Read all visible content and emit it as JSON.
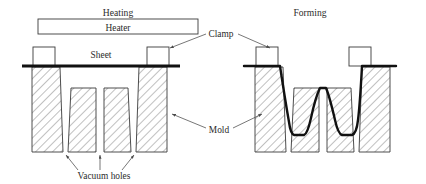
{
  "figure": {
    "caption_left": "Heating",
    "caption_right": "Forming",
    "heater_label": "Heater",
    "sheet_label": "Sheet",
    "clamp_label": "Clamp",
    "mold_label": "Mold",
    "vacuum_label": "Vacuum holes"
  },
  "colors": {
    "outline": "#3a3a3a",
    "sheet": "#111111",
    "hatch": "#6a6a6a",
    "text": "#2b2b2b",
    "leader": "#4a4a4a",
    "background": "#ffffff"
  },
  "geometry": {
    "canvas_width": 426,
    "canvas_height": 184,
    "baseline_y": 152,
    "sheet_y": 66,
    "heater_box": {
      "x": 38,
      "y": 19,
      "width": 160,
      "height": 15
    },
    "left_stage": {
      "clamp_left": {
        "x": 33,
        "y": 47,
        "width": 22,
        "height": 19
      },
      "clamp_right": {
        "x": 147,
        "y": 47,
        "width": 22,
        "height": 19
      },
      "molds": [
        {
          "name": "mold-block-1",
          "top_left": 32,
          "top_right": 60,
          "bottom_left": 32,
          "bottom_right": 63
        },
        {
          "name": "mold-block-2",
          "top_left": 71,
          "top_right": 96,
          "bottom_left": 68,
          "bottom_right": 96
        },
        {
          "name": "mold-block-3",
          "top_left": 104,
          "top_right": 128,
          "bottom_left": 104,
          "bottom_right": 131
        },
        {
          "name": "mold-block-4",
          "top_left": 139,
          "top_right": 167,
          "bottom_left": 136,
          "bottom_right": 167
        }
      ]
    },
    "right_stage": {
      "clamp_left": {
        "x": 256,
        "y": 47,
        "width": 22,
        "height": 19
      },
      "clamp_right": {
        "x": 349,
        "y": 47,
        "width": 22,
        "height": 19
      },
      "molds": [
        {
          "name": "mold-block-1",
          "top_left": 255,
          "top_right": 283,
          "bottom_left": 255,
          "bottom_right": 286
        },
        {
          "name": "mold-block-2",
          "top_left": 294,
          "top_right": 319,
          "bottom_left": 291,
          "bottom_right": 319
        },
        {
          "name": "mold-block-3",
          "top_left": 327,
          "top_right": 351,
          "bottom_left": 327,
          "bottom_right": 354
        },
        {
          "name": "mold-block-4",
          "top_left": 362,
          "top_right": 390,
          "bottom_left": 359,
          "bottom_right": 390
        }
      ]
    }
  },
  "labels": {
    "heating_pos": {
      "x": 118,
      "y": 16
    },
    "forming_pos": {
      "x": 310,
      "y": 16
    },
    "heater_pos": {
      "x": 118,
      "y": 31
    },
    "sheet_pos": {
      "x": 101,
      "y": 58
    },
    "clamp_pos": {
      "x": 221,
      "y": 35
    },
    "mold_pos": {
      "x": 219,
      "y": 132
    },
    "vacuum_pos": {
      "x": 104,
      "y": 178
    }
  }
}
